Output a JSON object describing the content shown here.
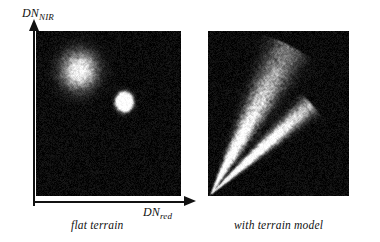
{
  "figure": {
    "background_color": "#ffffff",
    "ink_color": "#111111",
    "panel_background_color": "#050505"
  },
  "axes": {
    "y_label_main": "DN",
    "y_label_sub": "NIR",
    "x_label_main": "DN",
    "x_label_sub": "red",
    "y_arrow_icon": "up-arrow-icon",
    "x_arrow_icon": "right-arrow-icon"
  },
  "panels": [
    {
      "id": "flat",
      "caption": "flat terrain",
      "description": "scatter density plot with two bright clusters on dark noise background"
    },
    {
      "id": "model",
      "caption": "with terrain model",
      "description": "scatter density plot with two elongated wedges radiating from the origin corner"
    }
  ],
  "chart_data": {
    "type": "scatter",
    "title": "",
    "xlabel": "DN_red",
    "ylabel": "DN_NIR",
    "panels": [
      {
        "name": "flat terrain",
        "noise_density": 0.35,
        "noise_brightness": 46,
        "clusters": [
          {
            "name": "diffuse-cluster",
            "cx_frac": 0.3,
            "cy_frac": 0.24,
            "rx_frac": 0.21,
            "ry_frac": 0.2,
            "peak_brightness": 150,
            "softness": 1.0,
            "points": 26000
          },
          {
            "name": "compact-bright-cluster",
            "cx_frac": 0.61,
            "cy_frac": 0.43,
            "rx_frac": 0.105,
            "ry_frac": 0.105,
            "peak_brightness": 255,
            "softness": 0.55,
            "points": 17000
          }
        ],
        "wedges": []
      },
      {
        "name": "with terrain model",
        "noise_density": 0.35,
        "noise_brightness": 46,
        "clusters": [],
        "wedges": [
          {
            "name": "upper-wedge",
            "origin_x_frac": 0.02,
            "origin_y_frac": 0.99,
            "angle_center_deg": 62,
            "angle_spread_deg": 11,
            "length_frac": 1.02,
            "peak_brightness": 215,
            "points": 30000
          },
          {
            "name": "lower-wedge",
            "origin_x_frac": 0.02,
            "origin_y_frac": 0.99,
            "angle_center_deg": 42,
            "angle_spread_deg": 7,
            "length_frac": 0.82,
            "peak_brightness": 195,
            "points": 22000
          }
        ]
      }
    ]
  }
}
